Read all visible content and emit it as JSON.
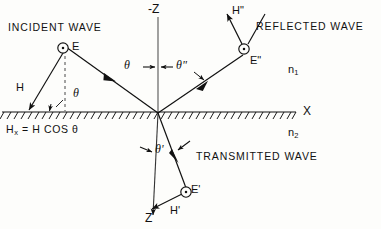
{
  "figure": {
    "type": "optics-ray-diagram",
    "background_color": "#fdfdfb",
    "ink_color": "#111111"
  },
  "axes": {
    "vertical_top_label": "-Z",
    "vertical_bottom_label": "Z",
    "horizontal_label": "X",
    "origin": {
      "x": 158,
      "y": 113
    }
  },
  "media": {
    "upper": {
      "symbol": "n",
      "subscript": "1"
    },
    "lower": {
      "symbol": "n",
      "subscript": "2"
    }
  },
  "regions": [
    {
      "name": "incident",
      "label": "INCIDENT  WAVE",
      "x": 8,
      "y": 22
    },
    {
      "name": "reflected",
      "label": "REFLECTED  WAVE",
      "x": 256,
      "y": 21
    },
    {
      "name": "transmitted",
      "label": "TRANSMITTED  WAVE",
      "x": 196,
      "y": 151
    }
  ],
  "field_vectors": [
    {
      "name": "E-incident",
      "label": "E",
      "x": 72,
      "y": 41,
      "kind": "out-of-page-circle"
    },
    {
      "name": "H-incident",
      "label": "H",
      "x": 16,
      "y": 82,
      "kind": "arrow"
    },
    {
      "name": "E-reflected",
      "label": "E\"",
      "x": 250,
      "y": 55,
      "kind": "out-of-page-circle"
    },
    {
      "name": "H-reflected",
      "label": "H\"",
      "x": 232,
      "y": 6,
      "kind": "arrow"
    },
    {
      "name": "E-transmitted",
      "label": "E'",
      "x": 191,
      "y": 184,
      "kind": "out-of-page-circle"
    },
    {
      "name": "H-transmitted",
      "label": "H'",
      "x": 170,
      "y": 206,
      "kind": "arrow"
    }
  ],
  "angles": [
    {
      "name": "theta-incident",
      "label": "θ",
      "x": 76,
      "y": 88
    },
    {
      "name": "theta-reflection-left",
      "label": "θ",
      "x": 125,
      "y": 60
    },
    {
      "name": "theta-double-prime",
      "label": "θ\"",
      "x": 176,
      "y": 60
    },
    {
      "name": "theta-prime",
      "label": "θ'",
      "x": 156,
      "y": 144
    }
  ],
  "equation": {
    "name": "h-tangential-component",
    "lhs_symbol": "H",
    "lhs_subscript": "x",
    "rhs": "= H COS θ",
    "x": 6,
    "y": 124
  }
}
